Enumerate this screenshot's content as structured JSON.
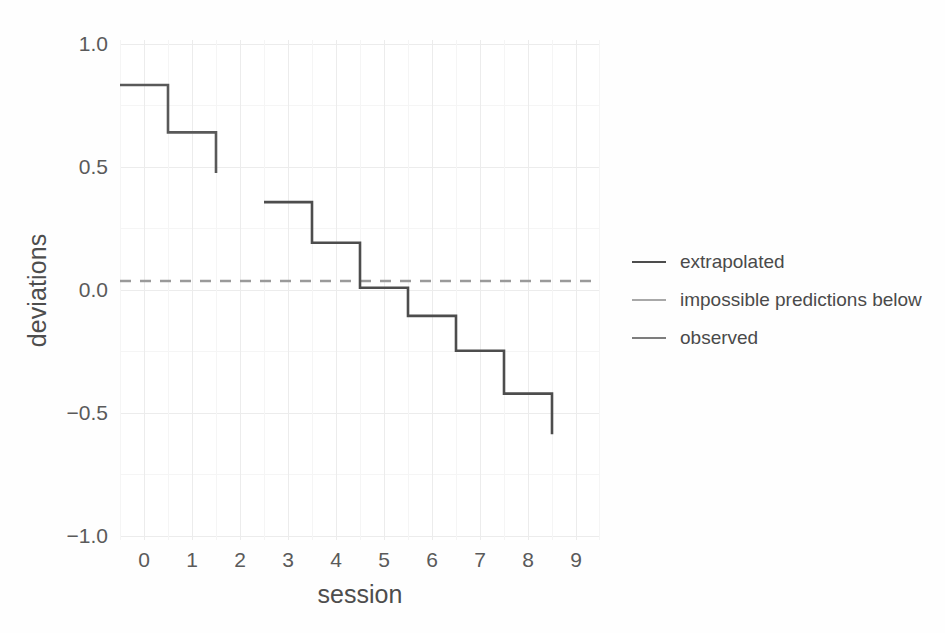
{
  "chart_data": {
    "type": "line",
    "subtype": "step",
    "title": "",
    "xlabel": "session",
    "ylabel": "deviations",
    "xlim": [
      -0.5,
      9.5
    ],
    "ylim": [
      -1.15,
      1.07
    ],
    "x": [
      0,
      1,
      2,
      3,
      4,
      5,
      6,
      7,
      8,
      9
    ],
    "xticks": [
      "0",
      "1",
      "2",
      "3",
      "4",
      "5",
      "6",
      "7",
      "8",
      "9"
    ],
    "yticks": [
      "1.0",
      "0.5",
      "0.0",
      "-0.5",
      "-1.0"
    ],
    "ytick_values": [
      1.0,
      0.5,
      0.0,
      -0.5,
      -1.0
    ],
    "grid": true,
    "grid_major_color": "#ececec",
    "grid_minor_color": "#f5f5f5",
    "legend_position": "right",
    "series": [
      {
        "name": "observed",
        "color": "#595959",
        "x": [
          0,
          1,
          2
        ],
        "values": [
          0.87,
          0.66,
          0.48
        ],
        "note": "step segment for sessions 0-2, final vertical drop to 0.48"
      },
      {
        "name": "extrapolated",
        "color": "#4d4d4d",
        "x": [
          3,
          4,
          5,
          6,
          7,
          8,
          9
        ],
        "values": [
          0.35,
          0.17,
          -0.03,
          -0.155,
          -0.31,
          -0.5,
          -0.68
        ],
        "note": "step segment for sessions 3-9, final vertical drop to -0.68"
      },
      {
        "name": "impossible predictions below",
        "color": "#9a9a9a",
        "x": [
          -0.5,
          9.5
        ],
        "values": [
          0.0,
          0.0
        ],
        "style": "dashed",
        "note": "horizontal dashed reference line at y = 0"
      }
    ],
    "annotations": []
  },
  "axes": {
    "y_title": "deviations",
    "x_title": "session",
    "y_ticklabels": [
      "1.0",
      "0.5",
      "0.0",
      "−0.5",
      "−1.0"
    ],
    "x_ticklabels": [
      "0",
      "1",
      "2",
      "3",
      "4",
      "5",
      "6",
      "7",
      "8",
      "9"
    ]
  },
  "legend": {
    "items": [
      {
        "label": "extrapolated",
        "color": "#4d4d4d"
      },
      {
        "label": "impossible predictions below",
        "color": "#a8a8a8"
      },
      {
        "label": "observed",
        "color": "#7d7d7d"
      }
    ]
  },
  "colors": {
    "background": "#fefefe",
    "panel": "#ffffff",
    "text": "#4d4d4d",
    "tick_text": "#5a5a5a",
    "line_dark": "#595959",
    "line_light": "#9a9a9a"
  }
}
